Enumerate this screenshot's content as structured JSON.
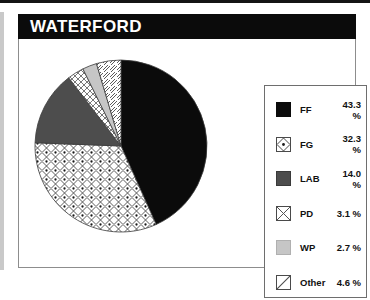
{
  "header": {
    "title": "WATERFORD"
  },
  "chart_data": {
    "type": "pie",
    "title": "WATERFORD",
    "xlabel": "",
    "ylabel": "",
    "legend_position": "right",
    "grid": false,
    "unit": "%",
    "categories": [
      "FF",
      "FG",
      "LAB",
      "PD",
      "WP",
      "Other"
    ],
    "values": [
      43.3,
      32.3,
      14.0,
      3.1,
      2.7,
      4.6
    ],
    "labels": [
      "43.3 %",
      "32.3 %",
      "14.0 %",
      "3.1 %",
      "2.7 %",
      "4.6 %"
    ],
    "start_angle_deg": 0,
    "direction": "clockwise",
    "slices": [
      {
        "name": "FF",
        "value": 43.3,
        "label": "43.3 %",
        "fill": "solid-black",
        "color": "#0b0b0b",
        "swatch": "solid-black"
      },
      {
        "name": "FG",
        "value": 32.3,
        "label": "32.3 %",
        "fill": "diamond-dot",
        "color": "#ffffff",
        "swatch": "diamond-dot"
      },
      {
        "name": "LAB",
        "value": 14.0,
        "label": "14.0 %",
        "fill": "solid-dark-gray",
        "color": "#4d4d4d",
        "swatch": "dark-gray"
      },
      {
        "name": "PD",
        "value": 3.1,
        "label": "3.1 %",
        "fill": "cross-hatch",
        "color": "#ffffff",
        "swatch": "cross-hatch"
      },
      {
        "name": "WP",
        "value": 2.7,
        "label": "2.7 %",
        "fill": "solid-light-gray",
        "color": "#c6c6c6",
        "swatch": "light-gray"
      },
      {
        "name": "Other",
        "value": 4.6,
        "label": "4.6 %",
        "fill": "diagonal-stripe",
        "color": "#ffffff",
        "swatch": "diagonal-stripe"
      }
    ]
  },
  "legend": {
    "rows": [
      {
        "label": "FF",
        "value": "43.3 %"
      },
      {
        "label": "FG",
        "value": "32.3 %"
      },
      {
        "label": "LAB",
        "value": "14.0 %"
      },
      {
        "label": "PD",
        "value": "3.1 %"
      },
      {
        "label": "WP",
        "value": "2.7 %"
      },
      {
        "label": "Other",
        "value": "4.6 %"
      }
    ]
  },
  "colors": {
    "title_bar": "#0b0b0b",
    "title_text": "#ffffff",
    "panel_border": "#8d8d8d",
    "legend_border": "#6e6e6e",
    "slice_ff": "#0b0b0b",
    "slice_lab": "#4d4d4d",
    "slice_wp": "#c6c6c6"
  }
}
